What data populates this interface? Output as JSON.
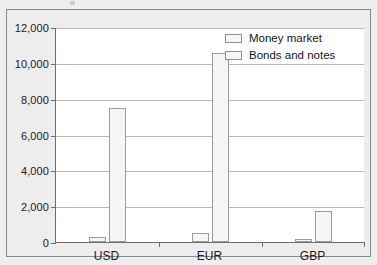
{
  "chart_data": {
    "type": "bar",
    "title": "",
    "subtitle": "",
    "xlabel": "",
    "ylabel": "",
    "categories": [
      "USD",
      "EUR",
      "GBP"
    ],
    "series": [
      {
        "name": "Money market",
        "values": [
          300,
          480,
          150
        ]
      },
      {
        "name": "Bonds and notes",
        "values": [
          7500,
          10550,
          1720
        ]
      }
    ],
    "ylim": [
      0,
      12000
    ],
    "ytick_labels": [
      "0",
      "2,000",
      "4,000",
      "6,000",
      "8,000",
      "10,000",
      "12,000"
    ],
    "ytick_values": [
      0,
      2000,
      4000,
      6000,
      8000,
      10000,
      12000
    ],
    "grid": true,
    "legend_position": "top-right",
    "colors": {
      "bar_fill": "#f6f6f6",
      "bar_border": "#9a9a9a",
      "gridline": "#b9b9b9",
      "axis": "#6f6f6f",
      "plot_background": "#ffffff",
      "figure_background": "#ededed",
      "figure_border": "#8a8a8a",
      "text": "#1b1b1b"
    }
  },
  "legend": {
    "items": [
      {
        "label": "Money market"
      },
      {
        "label": "Bonds and notes"
      }
    ]
  }
}
